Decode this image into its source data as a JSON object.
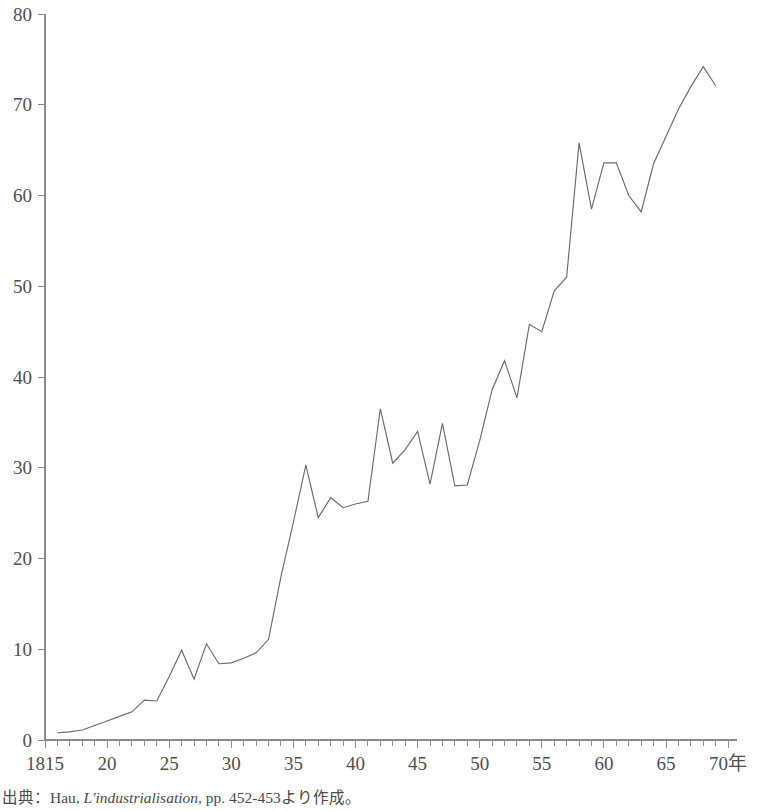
{
  "chart_data": {
    "type": "line",
    "title": "",
    "xlabel": "年",
    "ylabel": "",
    "xlim": [
      1815,
      1870
    ],
    "ylim": [
      0,
      80
    ],
    "grid": false,
    "legend": "none",
    "x_tick_labels": [
      "1815",
      "20",
      "25",
      "30",
      "35",
      "40",
      "45",
      "50",
      "55",
      "60",
      "65",
      "70年"
    ],
    "x_tick_values": [
      1815,
      1820,
      1825,
      1830,
      1835,
      1840,
      1845,
      1850,
      1855,
      1860,
      1865,
      1870
    ],
    "x_minor_tick_step": 1,
    "y_tick_labels": [
      "0",
      "10",
      "20",
      "30",
      "40",
      "50",
      "60",
      "70",
      "80"
    ],
    "y_tick_values": [
      0,
      10,
      20,
      30,
      40,
      50,
      60,
      70,
      80
    ],
    "series": [
      {
        "name": "",
        "color": "#6b6b6b",
        "x": [
          1816,
          1817,
          1818,
          1819,
          1820,
          1821,
          1822,
          1823,
          1824,
          1825,
          1826,
          1827,
          1828,
          1829,
          1830,
          1831,
          1832,
          1833,
          1834,
          1835,
          1836,
          1837,
          1838,
          1839,
          1840,
          1841,
          1842,
          1843,
          1844,
          1845,
          1846,
          1847,
          1848,
          1849,
          1850,
          1851,
          1852,
          1853,
          1854,
          1855,
          1856,
          1857,
          1858,
          1859,
          1860,
          1861,
          1862,
          1863,
          1864,
          1865,
          1866,
          1867,
          1868,
          1869
        ],
        "values": [
          0.8,
          0.9,
          1.1,
          1.6,
          2.1,
          2.6,
          3.1,
          4.4,
          4.3,
          7.0,
          9.9,
          6.7,
          10.6,
          8.4,
          8.5,
          9.0,
          9.6,
          11.1,
          18.0,
          24.0,
          30.3,
          24.5,
          26.7,
          25.6,
          26.0,
          26.3,
          36.5,
          30.5,
          32.0,
          34.0,
          28.2,
          34.9,
          28.0,
          28.1,
          33.0,
          38.6,
          41.8,
          37.7,
          45.8,
          45.0,
          49.5,
          51.0,
          65.8,
          58.5,
          63.6,
          63.6,
          60.0,
          58.2,
          63.5,
          66.5,
          69.5,
          72.0,
          74.2,
          72.1
        ]
      }
    ]
  },
  "source": {
    "prefix": "出典：Hau, ",
    "italic_title": "L'industrialisation",
    "suffix": ", pp. 452-453より作成。"
  }
}
